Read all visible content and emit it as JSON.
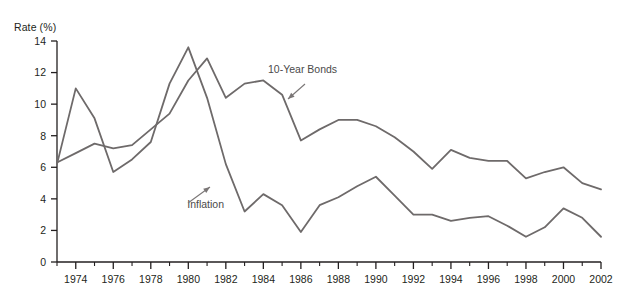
{
  "figure": {
    "y_axis_title": "Rate (%)",
    "background_color": "#ffffff",
    "line_color": "#6e6a6a",
    "axis_color": "#231f20"
  },
  "chart_data": {
    "type": "line",
    "title": "",
    "subtitle": "",
    "xlabel": "",
    "ylabel": "Rate (%)",
    "xlim": [
      1973,
      2002
    ],
    "ylim": [
      0,
      14
    ],
    "ytick_labels": [
      "0",
      "2",
      "4",
      "6",
      "8",
      "10",
      "12",
      "14"
    ],
    "yticks": [
      0,
      2,
      4,
      6,
      8,
      10,
      12,
      14
    ],
    "xtick_labels": [
      "1974",
      "1976",
      "1978",
      "1980",
      "1982",
      "1984",
      "1986",
      "1988",
      "1990",
      "1992",
      "1994",
      "1996",
      "1998",
      "2000",
      "2002"
    ],
    "xticks": [
      1974,
      1976,
      1978,
      1980,
      1982,
      1984,
      1986,
      1988,
      1990,
      1992,
      1994,
      1996,
      1998,
      2000,
      2002
    ],
    "minor_xticks": [
      1973,
      1975,
      1977,
      1979,
      1981,
      1983,
      1985,
      1987,
      1989,
      1991,
      1993,
      1995,
      1997,
      1999,
      2001
    ],
    "grid": false,
    "legend_position": "inline-annotations",
    "x": [
      1973,
      1974,
      1975,
      1976,
      1977,
      1978,
      1979,
      1980,
      1981,
      1982,
      1983,
      1984,
      1985,
      1986,
      1987,
      1988,
      1989,
      1990,
      1991,
      1992,
      1993,
      1994,
      1995,
      1996,
      1997,
      1998,
      1999,
      2000,
      2001,
      2002
    ],
    "series": [
      {
        "name": "10-Year Bonds",
        "label": "10-Year Bonds",
        "values": [
          6.3,
          6.9,
          7.5,
          7.2,
          7.4,
          8.4,
          9.4,
          11.5,
          12.9,
          10.4,
          11.3,
          11.5,
          10.6,
          7.7,
          8.4,
          9.0,
          9.0,
          8.6,
          7.9,
          7.0,
          5.9,
          7.1,
          6.6,
          6.4,
          6.4,
          5.3,
          5.7,
          6.0,
          5.0,
          4.6
        ]
      },
      {
        "name": "Inflation",
        "label": "Inflation",
        "values": [
          6.2,
          11.0,
          9.1,
          5.7,
          6.5,
          7.6,
          11.3,
          13.6,
          10.4,
          6.2,
          3.2,
          4.3,
          3.6,
          1.9,
          3.6,
          4.1,
          4.8,
          5.4,
          4.2,
          3.0,
          3.0,
          2.6,
          2.8,
          2.9,
          2.3,
          1.6,
          2.2,
          3.4,
          2.8,
          1.6
        ]
      }
    ],
    "annotations": [
      {
        "text": "10-Year Bonds",
        "series": "10-Year Bonds",
        "pointer": "arrow-down-left"
      },
      {
        "text": "Inflation",
        "series": "Inflation",
        "pointer": "arrow-up-right"
      }
    ]
  }
}
